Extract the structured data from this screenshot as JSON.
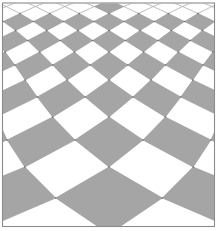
{
  "figure": {
    "name": "perspective-checkerboard-floor",
    "canvas": {
      "width": 219,
      "height": 231,
      "background": "#ffffff"
    },
    "frame": {
      "x": 2.5,
      "y": 3,
      "width": 212,
      "height": 223.5,
      "stroke": "#8c8c8c",
      "stroke_width": 1.1
    },
    "floor": {
      "center_x": 109,
      "row_boundaries": [
        234,
        198,
        167,
        140,
        117,
        97,
        80,
        65,
        52,
        40.5,
        30.5,
        21.5,
        13.5,
        6.5,
        0.5
      ],
      "tile_width": {
        "a": 29.3,
        "b": 0,
        "c": 0.00197
      },
      "filled_row_max": 11,
      "apex_row": 12,
      "tile_fill_color": "#a5a5a5",
      "tile_white_color": "#ffffff",
      "line_color": "#9a9a9a",
      "line_width": 0.65,
      "node_dot_color": "#686868",
      "node_dot_radius": 0.8,
      "column_limit": 14,
      "dot_column_limit": 8
    }
  }
}
